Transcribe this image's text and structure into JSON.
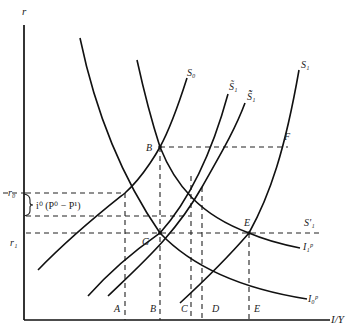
{
  "diagram": {
    "title": "",
    "axes": {
      "y_label": "r",
      "x_label": "I/Y",
      "y_ticks": [
        "r₀",
        "r₁"
      ],
      "x_ticks": [
        "A",
        "B",
        "C",
        "D",
        "E"
      ]
    },
    "annotation": "i⁰ (P⁰ − P¹)",
    "curves": {
      "S0": "S₀",
      "S1_tilde": "S̃₁",
      "S1_doubletilde": "S̃̃₁",
      "S1": "S₁",
      "S1_prime": "S′₁",
      "I0p": "I₀ᵖ",
      "I1p": "I₁ᵖ"
    },
    "points": {
      "B": "B",
      "G": "G",
      "E": "E",
      "F": "F"
    }
  }
}
